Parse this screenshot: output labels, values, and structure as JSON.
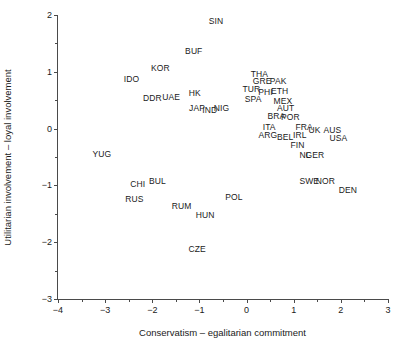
{
  "chart_data": {
    "type": "scatter",
    "title": "",
    "xlabel": "Conservatism – egalitarian commitment",
    "ylabel": "Utilitarian involvement – loyal involvement",
    "xlim": [
      -4,
      3
    ],
    "ylim": [
      -3,
      2
    ],
    "xticks": [
      -4,
      -3,
      -2,
      -1,
      0,
      1,
      2,
      3
    ],
    "xticklabels": [
      "−4",
      "−3",
      "−2",
      "−1",
      "0",
      "1",
      "2",
      "3"
    ],
    "yticks": [
      -3,
      -2,
      -1,
      0,
      1,
      2
    ],
    "yticklabels": [
      "−3",
      "−2",
      "−1",
      "0",
      "1",
      "2"
    ],
    "grid": false,
    "legend": null,
    "marker": "text-label",
    "points": [
      {
        "label": "SIN",
        "x": -0.65,
        "y": 1.89
      },
      {
        "label": "BUF",
        "x": -1.12,
        "y": 1.36
      },
      {
        "label": "KOR",
        "x": -1.83,
        "y": 1.06
      },
      {
        "label": "IDO",
        "x": -2.44,
        "y": 0.88
      },
      {
        "label": "THA",
        "x": 0.27,
        "y": 0.96
      },
      {
        "label": "GRE",
        "x": 0.33,
        "y": 0.83
      },
      {
        "label": "PAK",
        "x": 0.67,
        "y": 0.84
      },
      {
        "label": "TUR",
        "x": 0.1,
        "y": 0.7
      },
      {
        "label": "PHI",
        "x": 0.4,
        "y": 0.65
      },
      {
        "label": "ETH",
        "x": 0.7,
        "y": 0.66
      },
      {
        "label": "DDR",
        "x": -2.0,
        "y": 0.53
      },
      {
        "label": "UAE",
        "x": -1.6,
        "y": 0.55
      },
      {
        "label": "HK",
        "x": -1.1,
        "y": 0.63
      },
      {
        "label": "SPA",
        "x": 0.14,
        "y": 0.52
      },
      {
        "label": "MEX",
        "x": 0.77,
        "y": 0.48
      },
      {
        "label": "JAP",
        "x": -1.05,
        "y": 0.37
      },
      {
        "label": "IND",
        "x": -0.78,
        "y": 0.33
      },
      {
        "label": "NIG",
        "x": -0.53,
        "y": 0.36
      },
      {
        "label": "AUT",
        "x": 0.83,
        "y": 0.36
      },
      {
        "label": "BRA",
        "x": 0.63,
        "y": 0.22
      },
      {
        "label": "POR",
        "x": 0.93,
        "y": 0.21
      },
      {
        "label": "ITA",
        "x": 0.48,
        "y": 0.03
      },
      {
        "label": "FRA",
        "x": 1.22,
        "y": 0.03
      },
      {
        "label": "UK",
        "x": 1.44,
        "y": -0.03
      },
      {
        "label": "AUS",
        "x": 1.82,
        "y": -0.03
      },
      {
        "label": "ARG",
        "x": 0.45,
        "y": -0.12
      },
      {
        "label": "BEL",
        "x": 0.82,
        "y": -0.14
      },
      {
        "label": "IRL",
        "x": 1.13,
        "y": -0.11
      },
      {
        "label": "USA",
        "x": 1.95,
        "y": -0.17
      },
      {
        "label": "FIN",
        "x": 1.08,
        "y": -0.28
      },
      {
        "label": "NL",
        "x": 1.24,
        "y": -0.47
      },
      {
        "label": "GER",
        "x": 1.45,
        "y": -0.47
      },
      {
        "label": "YUG",
        "x": -3.07,
        "y": -0.45
      },
      {
        "label": "SWE",
        "x": 1.33,
        "y": -0.93
      },
      {
        "label": "NOR",
        "x": 1.67,
        "y": -0.93
      },
      {
        "label": "DEN",
        "x": 2.15,
        "y": -1.08
      },
      {
        "label": "CHI",
        "x": -2.31,
        "y": -0.98
      },
      {
        "label": "BUL",
        "x": -1.89,
        "y": -0.93
      },
      {
        "label": "RUS",
        "x": -2.38,
        "y": -1.24
      },
      {
        "label": "POL",
        "x": -0.27,
        "y": -1.21
      },
      {
        "label": "RUM",
        "x": -1.38,
        "y": -1.36
      },
      {
        "label": "HUN",
        "x": -0.88,
        "y": -1.52
      },
      {
        "label": "CZE",
        "x": -1.05,
        "y": -2.12
      }
    ]
  }
}
